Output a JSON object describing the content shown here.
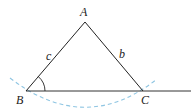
{
  "diagram": {
    "type": "geometry-triangle-construction",
    "vertices": [
      {
        "id": "A",
        "label": "A",
        "x": 85,
        "y": 22
      },
      {
        "id": "B",
        "label": "B",
        "x": 26,
        "y": 91
      },
      {
        "id": "C",
        "label": "C",
        "x": 143,
        "y": 91
      }
    ],
    "sides": [
      {
        "id": "c",
        "label": "c",
        "from": "B",
        "to": "A"
      },
      {
        "id": "b",
        "label": "b",
        "from": "A",
        "to": "C"
      }
    ],
    "baseline": {
      "from": "B",
      "to_x": 191
    },
    "angle_mark": {
      "at": "B",
      "radius": 19
    },
    "arc": {
      "style": "dashed",
      "color": "#8ec5e2",
      "center": "A"
    },
    "colors": {
      "line": "#222222",
      "arc": "#8ec5e2",
      "background": "#ffffff"
    }
  },
  "labels": {
    "A": "A",
    "B": "B",
    "C": "C",
    "b": "b",
    "c": "c"
  }
}
